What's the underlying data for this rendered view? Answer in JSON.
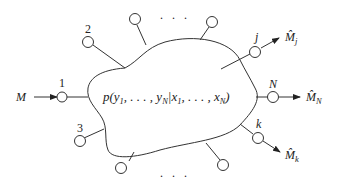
{
  "diagram": {
    "channel": {
      "formula_prefix": "p(y",
      "formula_sub1": "1",
      "formula_mid": ", . . . , y",
      "formula_subN": "N",
      "formula_bar": "|x",
      "formula_sub1b": "1",
      "formula_mid2": ", . . . , x",
      "formula_subN2": "N",
      "formula_close": ")"
    },
    "input": {
      "label": "M",
      "terminal": "1"
    },
    "terminals": [
      {
        "id": "1",
        "label": "1"
      },
      {
        "id": "2",
        "label": "2"
      },
      {
        "id": "3",
        "label": "3"
      },
      {
        "id": "j",
        "label": "j"
      },
      {
        "id": "N",
        "label": "N"
      },
      {
        "id": "k",
        "label": "k"
      }
    ],
    "outputs": [
      {
        "terminal": "j",
        "symbol": "M̂",
        "subscript": "j"
      },
      {
        "terminal": "N",
        "symbol": "M̂",
        "subscript": "N"
      },
      {
        "terminal": "k",
        "symbol": "M̂",
        "subscript": "k"
      }
    ],
    "ellipsis_top": ". . .",
    "ellipsis_bottom": ". . ."
  }
}
